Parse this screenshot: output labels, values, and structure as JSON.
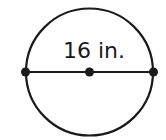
{
  "diagram": {
    "shape": "circle",
    "diameter_label": "16 in.",
    "points": [
      "left-endpoint",
      "center",
      "right-endpoint"
    ],
    "stroke_color": "#1a1a1a",
    "background_color": "#ffffff"
  }
}
